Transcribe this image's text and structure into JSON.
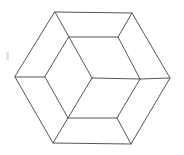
{
  "figure": {
    "stroke_color": "#555555",
    "background": "#ffffff",
    "outer_hexagon": [
      [
        55,
        12
      ],
      [
        132,
        13
      ],
      [
        170,
        78
      ],
      [
        131,
        144
      ],
      [
        53,
        143
      ],
      [
        15,
        77
      ]
    ],
    "inner_hexagon": [
      [
        69,
        37
      ],
      [
        118,
        37
      ],
      [
        140,
        79
      ],
      [
        117,
        118
      ],
      [
        68,
        118
      ],
      [
        45,
        77
      ]
    ],
    "center": [
      92,
      78
    ],
    "connectors": [
      [
        [
          55,
          12
        ],
        [
          69,
          37
        ]
      ],
      [
        [
          132,
          13
        ],
        [
          118,
          37
        ]
      ],
      [
        [
          170,
          78
        ],
        [
          140,
          79
        ]
      ],
      [
        [
          131,
          144
        ],
        [
          117,
          118
        ]
      ],
      [
        [
          53,
          143
        ],
        [
          68,
          118
        ]
      ],
      [
        [
          15,
          77
        ],
        [
          45,
          77
        ]
      ]
    ],
    "spokes": [
      [
        [
          92,
          78
        ],
        [
          69,
          37
        ]
      ],
      [
        [
          92,
          78
        ],
        [
          140,
          79
        ]
      ],
      [
        [
          92,
          78
        ],
        [
          68,
          118
        ]
      ]
    ]
  }
}
